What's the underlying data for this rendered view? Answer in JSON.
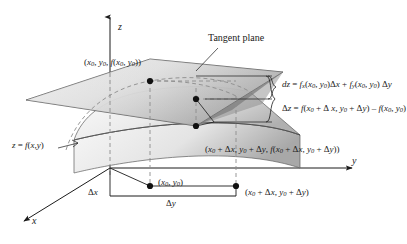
{
  "figure": {
    "title_label": "Tangent plane",
    "surface_label": "z = f(x,y)",
    "axes": {
      "z": "z",
      "y": "y",
      "x": "x"
    },
    "points": {
      "tangent_point": "(x0, y0, f(x0, y0))",
      "surface_point": "(x0 + Δx, y0 + Δy, f(x0 + Δx, y0 + Δy))",
      "base_point": "(x0, y0)",
      "base_point_shifted": "(x0 + Δx, y0 + Δy)"
    },
    "increments": {
      "dx": "Δx",
      "dy": "Δy"
    },
    "equations": {
      "dz": "dz = fx(x0, y0)Δx + fy(x0, y0) Δy",
      "delta_z": "Δz = f(x0 + Δx, y0 + Δy) − f(x0, y0)"
    },
    "colors": {
      "ink": "#1b1b1b",
      "plane_light": "#f2f2f2",
      "plane_dark": "#9a9a9a",
      "surface_light": "#fbfbfb",
      "surface_dark": "#b4b4b4",
      "dash": "#8c8c8c"
    }
  }
}
